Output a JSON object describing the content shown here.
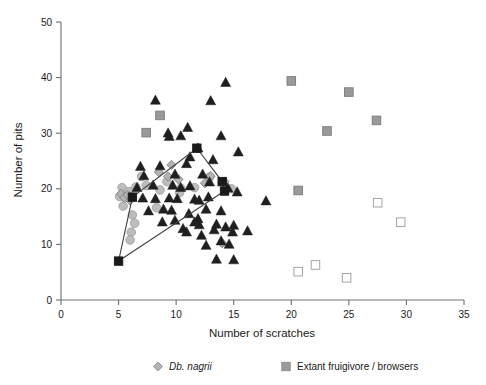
{
  "chart_data": {
    "type": "scatter",
    "title": "",
    "xlabel": "Number of scratches",
    "ylabel": "Number of  pits",
    "xlim": [
      0,
      35
    ],
    "ylim": [
      0,
      50
    ],
    "xticks": [
      0,
      5,
      10,
      15,
      20,
      25,
      30,
      35
    ],
    "yticks": [
      0,
      10,
      20,
      30,
      40,
      50
    ],
    "xticklabels": [
      "0",
      "5",
      "10",
      "15",
      "20",
      "25",
      "30",
      "35"
    ],
    "yticklabels": [
      "0",
      "10",
      "20",
      "30",
      "40",
      "50"
    ],
    "grid": false,
    "legend_position": "below-axes",
    "series": [
      {
        "name": "Db. nagrii",
        "marker": "diamond",
        "color": "#b3b3b3",
        "edge_color": "#808080",
        "points": [
          [
            5.2,
            19.1
          ],
          [
            5.5,
            18.4
          ],
          [
            5.8,
            18.9
          ],
          [
            6.0,
            17.9
          ],
          [
            9.6,
            24.3
          ],
          [
            9.3,
            22.2
          ],
          [
            10.2,
            21.7
          ],
          [
            12.5,
            21.0
          ],
          [
            13.0,
            22.3
          ],
          [
            14.2,
            21.3
          ],
          [
            14.0,
            10.2
          ],
          [
            8.5,
            23.0
          ]
        ]
      },
      {
        "name": "Extant fruigivore / browsers",
        "marker": "square",
        "color": "#9a9a9a",
        "edge_color": "#7a7a7a",
        "points": [
          [
            8.6,
            33.2
          ],
          [
            7.4,
            30.1
          ],
          [
            20.0,
            39.4
          ],
          [
            23.1,
            30.4
          ],
          [
            25.0,
            37.4
          ],
          [
            27.4,
            32.3
          ],
          [
            20.6,
            19.7
          ]
        ]
      },
      {
        "name": "open-squares",
        "marker": "square-open",
        "color": "#ffffff",
        "edge_color": "#9a9a9a",
        "points": [
          [
            20.6,
            5.1
          ],
          [
            22.1,
            6.3
          ],
          [
            24.8,
            4.0
          ],
          [
            27.5,
            17.5
          ],
          [
            29.5,
            14.0
          ]
        ]
      },
      {
        "name": "dark-triangles",
        "marker": "triangle",
        "color": "#1f1f1f",
        "edge_color": "#1f1f1f",
        "points": [
          [
            8.2,
            35.9
          ],
          [
            13.0,
            35.8
          ],
          [
            14.3,
            39.1
          ],
          [
            9.3,
            30.0
          ],
          [
            9.4,
            29.4
          ],
          [
            10.4,
            29.5
          ],
          [
            13.9,
            29.5
          ],
          [
            11.9,
            27.3
          ],
          [
            15.4,
            26.6
          ],
          [
            11.2,
            25.7
          ],
          [
            13.2,
            25.2
          ],
          [
            6.9,
            24.0
          ],
          [
            8.6,
            24.1
          ],
          [
            10.9,
            24.5
          ],
          [
            7.2,
            22.3
          ],
          [
            9.9,
            22.6
          ],
          [
            12.3,
            22.6
          ],
          [
            12.9,
            21.2
          ],
          [
            6.6,
            20.2
          ],
          [
            8.0,
            20.6
          ],
          [
            9.7,
            20.6
          ],
          [
            10.4,
            20.2
          ],
          [
            11.2,
            20.5
          ],
          [
            14.5,
            20.1
          ],
          [
            15.3,
            19.4
          ],
          [
            7.1,
            18.3
          ],
          [
            8.2,
            18.2
          ],
          [
            9.4,
            18.3
          ],
          [
            10.1,
            18.2
          ],
          [
            11.6,
            18.1
          ],
          [
            12.0,
            17.9
          ],
          [
            7.6,
            16.0
          ],
          [
            8.9,
            16.3
          ],
          [
            9.6,
            16.1
          ],
          [
            12.6,
            16.3
          ],
          [
            13.9,
            16.0
          ],
          [
            11.1,
            15.5
          ],
          [
            11.9,
            14.6
          ],
          [
            11.6,
            14.0
          ],
          [
            12.0,
            13.5
          ],
          [
            13.5,
            13.6
          ],
          [
            14.3,
            13.1
          ],
          [
            15.0,
            13.4
          ],
          [
            13.3,
            12.6
          ],
          [
            14.9,
            12.2
          ],
          [
            12.2,
            11.6
          ],
          [
            12.6,
            9.8
          ],
          [
            13.9,
            10.6
          ],
          [
            14.6,
            10.0
          ],
          [
            13.5,
            7.3
          ],
          [
            15.0,
            7.2
          ],
          [
            16.2,
            12.4
          ],
          [
            17.8,
            17.8
          ],
          [
            10.6,
            12.8
          ],
          [
            10.9,
            12.2
          ],
          [
            9.9,
            14.3
          ],
          [
            8.8,
            14.0
          ],
          [
            12.8,
            18.5
          ],
          [
            11.0,
            31.0
          ]
        ]
      },
      {
        "name": "convex-hull",
        "marker": "square-dark",
        "color": "#1a1a1a",
        "closed": true,
        "vertices": [
          [
            5.0,
            7.0
          ],
          [
            6.2,
            18.5
          ],
          [
            11.8,
            27.3
          ],
          [
            14.0,
            21.3
          ],
          [
            14.2,
            19.6
          ]
        ]
      }
    ],
    "legend": [
      {
        "label": "Db. nagrii",
        "marker": "diamond",
        "color": "#b3b3b3",
        "italic": true
      },
      {
        "label": "Extant fruigivore / browsers",
        "marker": "square",
        "color": "#9a9a9a",
        "italic": false
      }
    ]
  }
}
